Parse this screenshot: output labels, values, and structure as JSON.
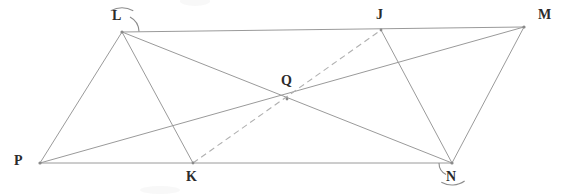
{
  "figure": {
    "width": 561,
    "height": 194,
    "background_color": "#ffffff",
    "line_color": "#9a9a9a",
    "dashed_line_color": "#b0b0b0",
    "arc_color": "#8c8c8c",
    "label_color": "#2b2b2b"
  },
  "points": [
    {
      "id": "P",
      "label": "P",
      "x": 40,
      "y": 163,
      "label_x": 14,
      "label_y": 154
    },
    {
      "id": "L",
      "label": "L",
      "x": 122,
      "y": 32,
      "label_x": 112,
      "label_y": 9
    },
    {
      "id": "K",
      "label": "K",
      "x": 193,
      "y": 163,
      "label_x": 186,
      "label_y": 170
    },
    {
      "id": "Q",
      "label": "Q",
      "x": 287,
      "y": 99,
      "label_x": 281,
      "label_y": 74
    },
    {
      "id": "J",
      "label": "J",
      "x": 381,
      "y": 30,
      "label_x": 376,
      "label_y": 8
    },
    {
      "id": "N",
      "label": "N",
      "x": 452,
      "y": 163,
      "label_x": 446,
      "label_y": 170
    },
    {
      "id": "M",
      "label": "M",
      "x": 524,
      "y": 27,
      "label_x": 538,
      "label_y": 8
    }
  ],
  "segments": [
    {
      "name": "segment-P-L",
      "from": "P",
      "to": "L",
      "style": "solid"
    },
    {
      "name": "segment-L-M",
      "from": "L",
      "to": "M",
      "style": "solid"
    },
    {
      "name": "segment-P-N",
      "from": "P",
      "to": "N",
      "style": "solid"
    },
    {
      "name": "segment-N-M",
      "from": "N",
      "to": "M",
      "style": "solid"
    },
    {
      "name": "segment-L-K",
      "from": "L",
      "to": "K",
      "style": "solid"
    },
    {
      "name": "segment-J-N",
      "from": "J",
      "to": "N",
      "style": "solid"
    },
    {
      "name": "diagonal-L-N",
      "from": "L",
      "to": "N",
      "style": "solid"
    },
    {
      "name": "diagonal-P-M",
      "from": "P",
      "to": "M",
      "style": "solid"
    },
    {
      "name": "dashed-K-J",
      "from": "K",
      "to": "J",
      "style": "dashed"
    }
  ],
  "angle_marks": [
    {
      "name": "angle-arc-at-L-outer",
      "vertex": "L",
      "radius": 24,
      "start_deg": 62,
      "end_deg": 118
    },
    {
      "name": "angle-arc-at-L-inner",
      "vertex": "L",
      "radius": 17,
      "start_deg": 2,
      "end_deg": 62
    },
    {
      "name": "angle-arc-at-N-outer",
      "vertex": "N",
      "radius": 22,
      "start_deg": 241,
      "end_deg": 305
    },
    {
      "name": "angle-arc-at-N-inner",
      "vertex": "N",
      "radius": 13,
      "start_deg": 180,
      "end_deg": 243
    }
  ]
}
